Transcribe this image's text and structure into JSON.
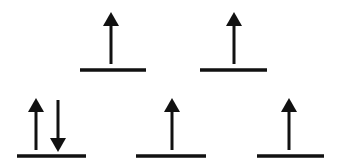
{
  "diagram": {
    "type": "orbital-energy-diagram",
    "stroke_color": "#111111",
    "background": "#ffffff",
    "levels": [
      {
        "name": "upper",
        "orbitals": [
          {
            "x1": 80,
            "x2": 146,
            "y": 70,
            "electrons": [
              {
                "spin": "up",
                "x": 111
              }
            ]
          },
          {
            "x1": 200,
            "x2": 267,
            "y": 70,
            "electrons": [
              {
                "spin": "up",
                "x": 234
              }
            ]
          }
        ]
      },
      {
        "name": "lower",
        "orbitals": [
          {
            "x1": 17,
            "x2": 86,
            "y": 156,
            "electrons": [
              {
                "spin": "up",
                "x": 36
              },
              {
                "spin": "down",
                "x": 58
              }
            ]
          },
          {
            "x1": 136,
            "x2": 206,
            "y": 156,
            "electrons": [
              {
                "spin": "up",
                "x": 172
              }
            ]
          },
          {
            "x1": 257,
            "x2": 324,
            "y": 156,
            "electrons": [
              {
                "spin": "up",
                "x": 289
              }
            ]
          }
        ]
      }
    ],
    "summary": {
      "upper_orbital_count": 2,
      "lower_orbital_count": 3,
      "total_electrons": 6
    }
  }
}
